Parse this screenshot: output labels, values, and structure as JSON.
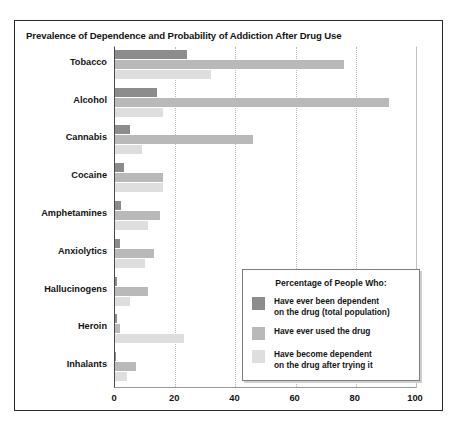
{
  "chart_data": {
    "type": "bar",
    "orientation": "horizontal",
    "title": "Prevalence of Dependence and Probability of Addiction After Drug Use",
    "xlabel": "",
    "ylabel": "",
    "xlim": [
      0,
      100
    ],
    "xticks": [
      0,
      20,
      40,
      60,
      80,
      100
    ],
    "grid": true,
    "legend_position": "inside-lower-right",
    "legend_title": "Percentage of People Who:",
    "categories": [
      "Tobacco",
      "Alcohol",
      "Cannabis",
      "Cocaine",
      "Amphetamines",
      "Anxiolytics",
      "Hallucinogens",
      "Heroin",
      "Inhalants"
    ],
    "series": [
      {
        "name": "Have ever been dependent on the drug (total population)",
        "name_line1": "Have ever been dependent",
        "name_line2": "on the drug (total population)",
        "color": "#8c8c8c",
        "values": [
          24,
          14,
          5,
          3,
          2,
          1.5,
          0.6,
          0.5,
          0.4
        ]
      },
      {
        "name": "Have ever used the drug",
        "name_line1": "Have ever used the drug",
        "name_line2": "",
        "color": "#b9b9b9",
        "values": [
          76,
          91,
          46,
          16,
          15,
          13,
          11,
          1.5,
          7
        ]
      },
      {
        "name": "Have become dependent on the drug after trying it",
        "name_line1": "Have become dependent",
        "name_line2": "on the drug after trying it",
        "color": "#dedede",
        "values": [
          32,
          16,
          9,
          16,
          11,
          10,
          5,
          23,
          4
        ]
      }
    ]
  }
}
